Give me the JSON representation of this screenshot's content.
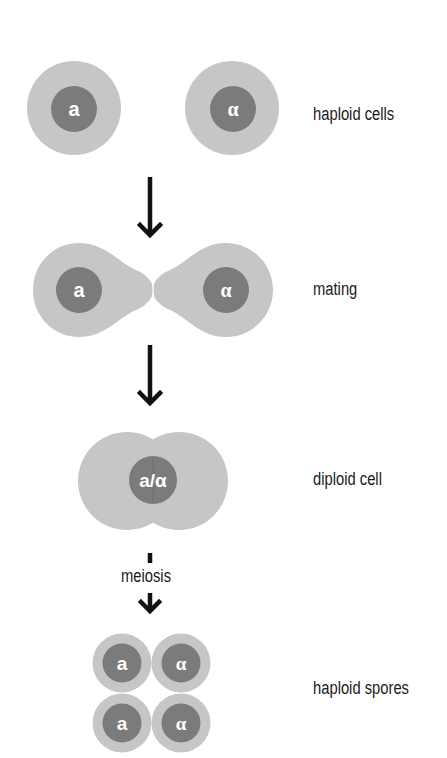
{
  "diagram": {
    "colors": {
      "cell_body": "#c6c6c6",
      "nucleus": "#7b7b7b",
      "nucleus_text": "#ffffff",
      "arrow": "#111111",
      "label_text": "#1a1a1a",
      "background": "#ffffff"
    },
    "stages": [
      {
        "id": "haploid-cells",
        "label": "haploid cells",
        "cells": [
          {
            "mating_type": "a"
          },
          {
            "mating_type": "α"
          }
        ]
      },
      {
        "id": "mating",
        "label": "mating",
        "cells": [
          {
            "mating_type": "a"
          },
          {
            "mating_type": "α"
          }
        ]
      },
      {
        "id": "diploid-cell",
        "label": "diploid cell",
        "cells": [
          {
            "mating_type": "a/α"
          }
        ]
      },
      {
        "id": "haploid-spores",
        "label": "haploid spores",
        "cells": [
          {
            "mating_type": "a"
          },
          {
            "mating_type": "α"
          },
          {
            "mating_type": "a"
          },
          {
            "mating_type": "α"
          }
        ]
      }
    ],
    "transitions": [
      {
        "from": "haploid-cells",
        "to": "mating",
        "label": ""
      },
      {
        "from": "mating",
        "to": "diploid-cell",
        "label": ""
      },
      {
        "from": "diploid-cell",
        "to": "haploid-spores",
        "label": "meiosis"
      }
    ]
  }
}
